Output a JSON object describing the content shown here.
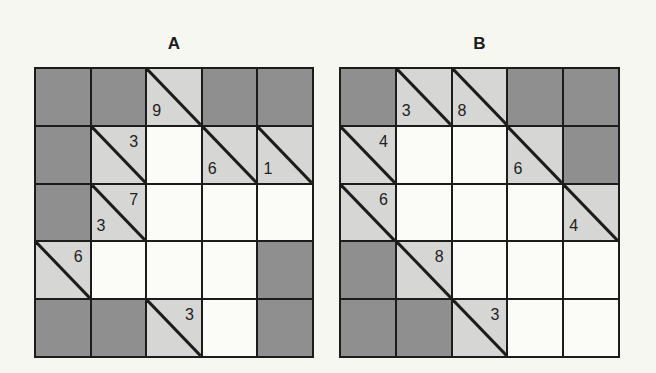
{
  "colors": {
    "background": "#f7f7f2",
    "blocked": "#8f8f8f",
    "clue": "#d6d6d4",
    "open": "#fbfbf8",
    "line": "#1c1c1c"
  },
  "puzzles": [
    {
      "title": "A",
      "rows": [
        [
          {
            "t": "dark"
          },
          {
            "t": "dark"
          },
          {
            "t": "clue",
            "down": "9"
          },
          {
            "t": "dark"
          },
          {
            "t": "dark"
          }
        ],
        [
          {
            "t": "dark"
          },
          {
            "t": "clue",
            "across": "3"
          },
          {
            "t": "white"
          },
          {
            "t": "clue",
            "down": "6"
          },
          {
            "t": "clue",
            "down": "1"
          }
        ],
        [
          {
            "t": "dark"
          },
          {
            "t": "clue",
            "across": "7",
            "down": "3"
          },
          {
            "t": "white"
          },
          {
            "t": "white"
          },
          {
            "t": "white"
          }
        ],
        [
          {
            "t": "clue",
            "across": "6"
          },
          {
            "t": "white"
          },
          {
            "t": "white"
          },
          {
            "t": "white"
          },
          {
            "t": "dark"
          }
        ],
        [
          {
            "t": "dark"
          },
          {
            "t": "dark"
          },
          {
            "t": "clue",
            "across": "3"
          },
          {
            "t": "white"
          },
          {
            "t": "dark"
          }
        ]
      ]
    },
    {
      "title": "B",
      "rows": [
        [
          {
            "t": "dark"
          },
          {
            "t": "clue",
            "down": "3"
          },
          {
            "t": "clue",
            "down": "8"
          },
          {
            "t": "dark"
          },
          {
            "t": "dark"
          }
        ],
        [
          {
            "t": "clue",
            "across": "4"
          },
          {
            "t": "white"
          },
          {
            "t": "white"
          },
          {
            "t": "clue",
            "down": "6"
          },
          {
            "t": "dark"
          }
        ],
        [
          {
            "t": "clue",
            "across": "6"
          },
          {
            "t": "white"
          },
          {
            "t": "white"
          },
          {
            "t": "white"
          },
          {
            "t": "clue",
            "down": "4"
          }
        ],
        [
          {
            "t": "dark"
          },
          {
            "t": "clue",
            "across": "8"
          },
          {
            "t": "white"
          },
          {
            "t": "white"
          },
          {
            "t": "white"
          }
        ],
        [
          {
            "t": "dark"
          },
          {
            "t": "dark"
          },
          {
            "t": "clue",
            "across": "3"
          },
          {
            "t": "white"
          },
          {
            "t": "white"
          }
        ]
      ]
    }
  ]
}
